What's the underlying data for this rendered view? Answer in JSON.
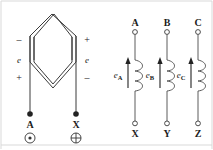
{
  "figure": {
    "background_color": "#ffffff",
    "line_color": "#3a3a3a",
    "text_color": "#1c1c1c"
  },
  "left_diagram": {
    "name": "hexagonal-coil",
    "description": "Diamond / hexagon shaped coil with two leads and polarity marks",
    "left_side": {
      "top_polarity": "–",
      "emf_label": "e",
      "bottom_polarity": "+",
      "terminal_label": "A",
      "terminal_symbol": "⊙"
    },
    "right_side": {
      "top_polarity": "+",
      "emf_label": "e",
      "bottom_polarity": "–",
      "terminal_label": "X",
      "terminal_symbol": "⊕"
    }
  },
  "right_diagram": {
    "name": "three-phase-windings",
    "description": "Three vertical coil windings with emf arrows",
    "phases": [
      {
        "top_terminal": "A",
        "bottom_terminal": "X",
        "emf_label": "e",
        "emf_subscript": "A",
        "arrow_direction": "up",
        "coil_turns": 3
      },
      {
        "top_terminal": "B",
        "bottom_terminal": "Y",
        "emf_label": "e",
        "emf_subscript": "B",
        "arrow_direction": "up",
        "coil_turns": 3
      },
      {
        "top_terminal": "C",
        "bottom_terminal": "Z",
        "emf_label": "e",
        "emf_subscript": "C",
        "arrow_direction": "up",
        "coil_turns": 3
      }
    ]
  }
}
